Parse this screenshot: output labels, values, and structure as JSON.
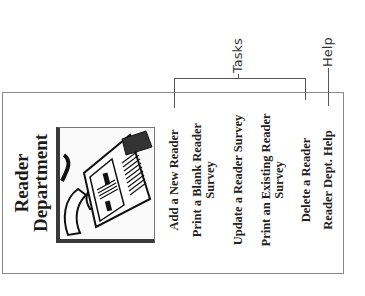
{
  "panel": {
    "title_line1": "Reader",
    "title_line2": "Department",
    "clipart": "person-reading-newspaper-illustration",
    "menu_items": [
      {
        "label": "Add a New Reader"
      },
      {
        "label": "Print a Blank Reader",
        "label_cont": "Survey"
      },
      {
        "label": "Update a Reader Survey"
      },
      {
        "label": "Print an Existing Reader",
        "label_cont": "Survey"
      },
      {
        "label": "Delete a Reader"
      },
      {
        "label": "Reader Dept. Help"
      }
    ]
  },
  "annotations": {
    "tasks_label": "Tasks",
    "help_label": "Help"
  },
  "colors": {
    "border": "#8a8a8a",
    "text": "#222222",
    "leader_line": "#555555"
  },
  "orientation": "rotated -90 degrees"
}
